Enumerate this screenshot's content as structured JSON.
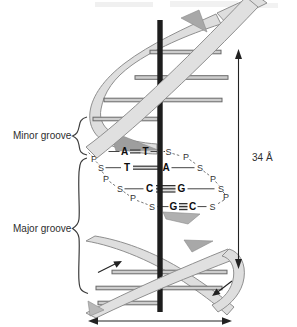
{
  "figure_labels": {
    "minor_groove": "Minor groove",
    "major_groove": "Major groove",
    "helix_repeat_distance": "34 Å"
  },
  "unwound_region": {
    "backbone_left": [
      "P",
      "S",
      "P",
      "S",
      "P",
      "S"
    ],
    "backbone_right": [
      "S",
      "P",
      "S",
      "P",
      "S",
      "P",
      "S"
    ],
    "base_pairs": [
      {
        "left": "A",
        "right": "T",
        "hydrogen_bonds": 2
      },
      {
        "left": "T",
        "right": "A",
        "hydrogen_bonds": 2
      },
      {
        "left": "C",
        "right": "G",
        "hydrogen_bonds": 3
      },
      {
        "left": "G",
        "right": "C",
        "hydrogen_bonds": 3
      }
    ]
  },
  "annotations": {
    "vertical_dimension_arrow": "34 Å",
    "horizontal_dimension_arrow": "",
    "strand_direction_arrows": [
      "up-right",
      "down-left"
    ]
  },
  "colors": {
    "ribbon_fill": "#dedede",
    "ribbon_edge": "#8f8f8f",
    "shade_fill": "#a8a8a8",
    "rung_fill": "#cdcdcd",
    "rung_edge": "#696969",
    "rod_fill": "#1d1d1d",
    "bond_shade": "#dcdcdc",
    "text": "#2e2e2e",
    "arrow": "#222222"
  }
}
